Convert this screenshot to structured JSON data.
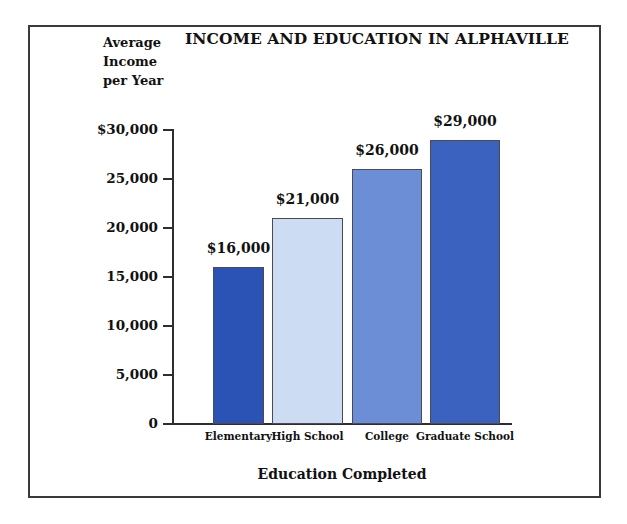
{
  "chart_data": {
    "type": "bar",
    "title": "INCOME AND EDUCATION IN ALPHAVILLE",
    "categories": [
      "Elementary",
      "High School",
      "College",
      "Graduate School"
    ],
    "values": [
      16000,
      21000,
      26000,
      29000
    ],
    "value_labels": [
      "$16,000",
      "$21,000",
      "$26,000",
      "$29,000"
    ],
    "bar_colors": [
      "#2b53b5",
      "#ccdcf2",
      "#6b8ed6",
      "#3c62bf"
    ],
    "xlabel": "Education Completed",
    "ylabel": "Average Income per Year",
    "ylabel_lines": [
      "Average",
      "Income",
      "per Year"
    ],
    "ylim": [
      0,
      30000
    ],
    "ytick_labels": [
      "$30,000",
      "25,000",
      "20,000",
      "15,000",
      "10,000",
      "5,000",
      "0"
    ],
    "ytick_values": [
      30000,
      25000,
      20000,
      15000,
      10000,
      5000,
      0
    ],
    "grid": false,
    "legend": false
  }
}
